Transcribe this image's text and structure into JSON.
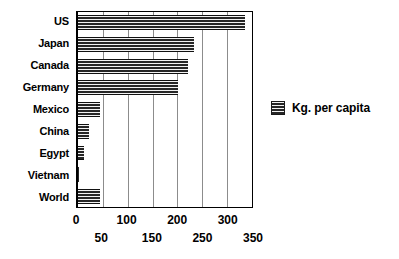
{
  "chart_data": {
    "type": "bar",
    "orientation": "horizontal",
    "title": "",
    "xlabel": "",
    "ylabel": "",
    "categories": [
      "US",
      "Japan",
      "Canada",
      "Germany",
      "Mexico",
      "China",
      "Egypt",
      "Vietnam",
      "World"
    ],
    "values": [
      335,
      233,
      221,
      202,
      45,
      22,
      12,
      1,
      45
    ],
    "series": [
      {
        "name": "Kg. per capita",
        "values": [
          335,
          233,
          221,
          202,
          45,
          22,
          12,
          1,
          45
        ]
      }
    ],
    "xlim": [
      0,
      350
    ],
    "ylim": null,
    "xticks": [
      0,
      50,
      100,
      150,
      200,
      250,
      300,
      350
    ],
    "xtick_labels": [
      "0",
      "50",
      "100",
      "150",
      "200",
      "250",
      "300",
      "350"
    ],
    "xtick_layout": "staggered-two-row",
    "xticks_row_top": [
      0,
      100,
      200,
      300
    ],
    "xticks_row_bottom": [
      50,
      150,
      250,
      350
    ],
    "grid": true,
    "grid_axis": "x",
    "legend_position": "right",
    "bar_color": "#262626",
    "bar_pattern": "horizontal-hatch",
    "grid_color": "#8c8c8c",
    "axis_color": "#000000",
    "background": "#ffffff"
  },
  "legend": {
    "entries": [
      {
        "label": "Kg. per capita",
        "swatch_name": "legend-swatch-kg-per-capita"
      }
    ]
  }
}
